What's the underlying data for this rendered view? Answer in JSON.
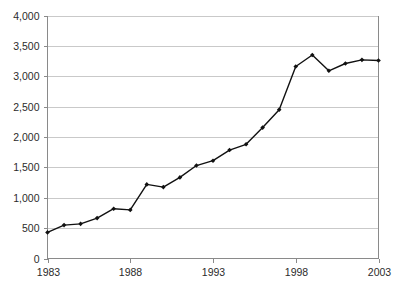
{
  "chart_data": {
    "type": "line",
    "title": "",
    "subtitle": "",
    "xlabel": "",
    "ylabel": "",
    "x": [
      1983,
      1984,
      1985,
      1986,
      1987,
      1988,
      1989,
      1990,
      1991,
      1992,
      1993,
      1994,
      1995,
      1996,
      1997,
      1998,
      1999,
      2000,
      2001,
      2002,
      2003
    ],
    "values": [
      430,
      550,
      570,
      665,
      820,
      800,
      1220,
      1175,
      1335,
      1530,
      1610,
      1785,
      1880,
      2155,
      2450,
      3160,
      3350,
      3090,
      3210,
      3270,
      3260
    ],
    "series": [
      {
        "name": "series-1",
        "values": [
          430,
          550,
          570,
          665,
          820,
          800,
          1220,
          1175,
          1335,
          1530,
          1610,
          1785,
          1880,
          2155,
          2450,
          3160,
          3350,
          3090,
          3210,
          3270,
          3260
        ]
      }
    ],
    "xlim": [
      1983,
      2003
    ],
    "ylim": [
      0,
      4000
    ],
    "xticks": [
      1983,
      1988,
      1993,
      1998,
      2003
    ],
    "xtick_labels": [
      "1983",
      "1988",
      "1993",
      "1998",
      "2003"
    ],
    "yticks": [
      0,
      500,
      1000,
      1500,
      2000,
      2500,
      3000,
      3500,
      4000
    ],
    "ytick_labels": [
      "0",
      "500",
      "1,000",
      "1,500",
      "2,000",
      "2,500",
      "3,000",
      "3,500",
      "4,000"
    ],
    "grid": "horizontal",
    "legend": "none",
    "marker": "diamond",
    "colors": {
      "line": "#111111",
      "marker": "#111111",
      "grid": "#c9c9c9",
      "axis": "#8a8a8a",
      "text": "#2b2b2b",
      "background": "#ffffff"
    }
  }
}
